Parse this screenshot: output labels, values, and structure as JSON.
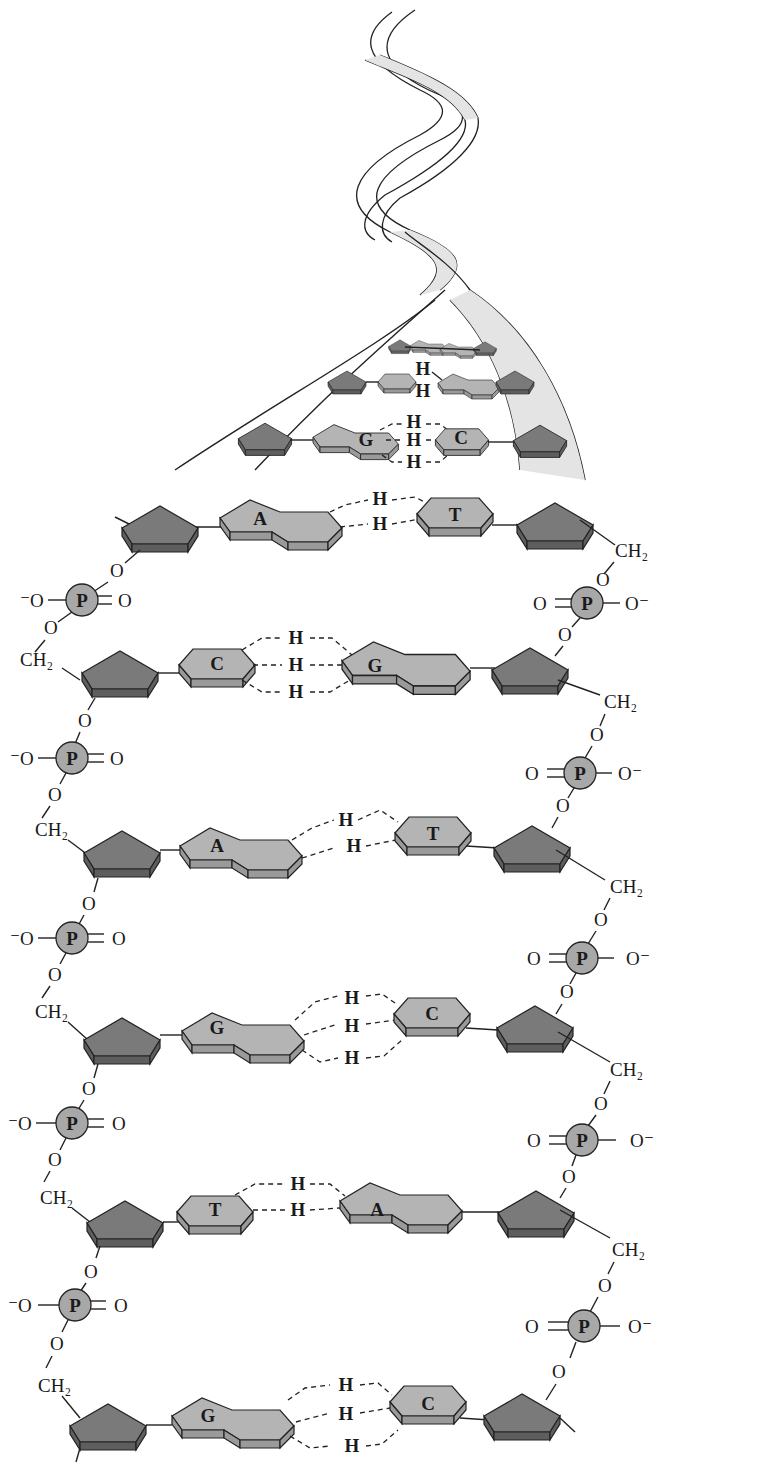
{
  "diagram": {
    "colors": {
      "sugar_top": "#7a7a7a",
      "sugar_side": "#5e5e5e",
      "base_top": "#b4b4b4",
      "base_side": "#9a9a9a",
      "phosphate": "#a8a8a8",
      "helix_ribbon": "#e4e4e4",
      "outline": "#222222"
    },
    "helix": {
      "upper_pairs": [
        {
          "left": "",
          "right": "",
          "h_labels": []
        },
        {
          "left": "",
          "right": "",
          "h_labels": [
            "H",
            "H"
          ]
        },
        {
          "left": "G",
          "right": "C",
          "h_labels": [
            "H",
            "H",
            "H"
          ]
        }
      ]
    },
    "pairs": [
      {
        "left": "A",
        "right": "T",
        "h_labels": [
          "H",
          "H"
        ]
      },
      {
        "left": "C",
        "right": "G",
        "h_labels": [
          "H",
          "H",
          "H"
        ]
      },
      {
        "left": "A",
        "right": "T",
        "h_labels": [
          "H",
          "H"
        ]
      },
      {
        "left": "G",
        "right": "C",
        "h_labels": [
          "H",
          "H",
          "H"
        ]
      },
      {
        "left": "T",
        "right": "A",
        "h_labels": [
          "H",
          "H"
        ]
      },
      {
        "left": "G",
        "right": "C",
        "h_labels": [
          "H",
          "H",
          "H"
        ]
      }
    ],
    "backbone": {
      "phosphate_label": "P",
      "oxygen_label": "O",
      "oxygen_minus_left": "⁻O",
      "oxygen_minus_right": "O⁻",
      "ch2_label": "CH₂"
    }
  }
}
